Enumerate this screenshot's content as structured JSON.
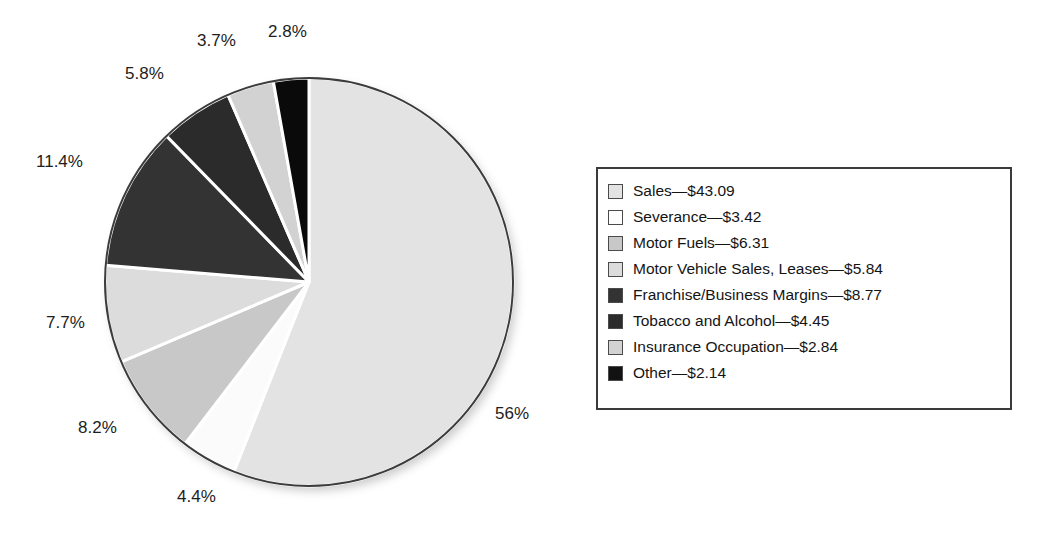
{
  "chart_data": {
    "type": "pie",
    "title": "",
    "subtitle": "",
    "xlabel": "",
    "ylabel": "",
    "legend_position": "right",
    "grid": false,
    "start_angle_deg": 0,
    "direction": "clockwise",
    "value_unit": "billion dollars",
    "categories": [
      "Sales",
      "Severance",
      "Motor Fuels",
      "Motor Vehicle Sales, Leases",
      "Franchise/Business Margins",
      "Tobacco and Alcohol",
      "Insurance Occupation",
      "Other"
    ],
    "values": [
      43.09,
      3.42,
      6.31,
      5.84,
      8.77,
      4.45,
      2.84,
      2.14
    ],
    "percents": [
      56,
      4.4,
      8.2,
      7.7,
      11.4,
      5.8,
      3.7,
      2.8
    ],
    "percent_labels": [
      "56%",
      "4.4%",
      "8.2%",
      "7.7%",
      "11.4%",
      "5.8%",
      "3.7%",
      "2.8%"
    ],
    "value_labels": [
      "$43.09",
      "$3.42",
      "$6.31",
      "$5.84",
      "$8.77",
      "$4.45",
      "$2.84",
      "$2.14"
    ],
    "colors": [
      "#e3e3e3",
      "#fbfbfb",
      "#c8c8c8",
      "#dcdcdc",
      "#333333",
      "#2b2b2b",
      "#d2d2d2",
      "#0a0a0a"
    ],
    "slice_outline_color": "#3c3c3c",
    "slice_gap_color": "#ffffff"
  },
  "pie": {
    "labels": [
      {
        "text": "2.8%",
        "left": 268,
        "top": 22
      },
      {
        "text": "3.7%",
        "left": 197,
        "top": 31
      },
      {
        "text": "5.8%",
        "left": 125,
        "top": 64
      },
      {
        "text": "11.4%",
        "left": 36,
        "top": 152
      },
      {
        "text": "7.7%",
        "left": 46,
        "top": 313
      },
      {
        "text": "8.2%",
        "left": 78,
        "top": 418
      },
      {
        "text": "4.4%",
        "left": 177,
        "top": 487
      },
      {
        "text": "56%",
        "left": 495,
        "top": 404
      }
    ]
  },
  "legend": {
    "items": [
      {
        "label": "Sales",
        "separator": "—",
        "value": "$43.09",
        "color": "#e3e3e3"
      },
      {
        "label": "Severance",
        "separator": "—",
        "value": "$3.42",
        "color": "#fdfdfd"
      },
      {
        "label": "Motor Fuels",
        "separator": "—",
        "value": "$6.31",
        "color": "#c8c8c8"
      },
      {
        "label": "Motor Vehicle Sales, Leases",
        "separator": "—",
        "value": "$5.84",
        "color": "#dcdcdc"
      },
      {
        "label": "Franchise/Business Margins",
        "separator": "—",
        "value": "$8.77",
        "color": "#333333"
      },
      {
        "label": "Tobacco and Alcohol",
        "separator": "—",
        "value": "$4.45",
        "color": "#2b2b2b"
      },
      {
        "label": "Insurance Occupation",
        "separator": "—",
        "value": "$2.84",
        "color": "#d2d2d2"
      },
      {
        "label": "Other",
        "separator": "—",
        "value": "$2.14",
        "color": "#121212"
      }
    ]
  }
}
